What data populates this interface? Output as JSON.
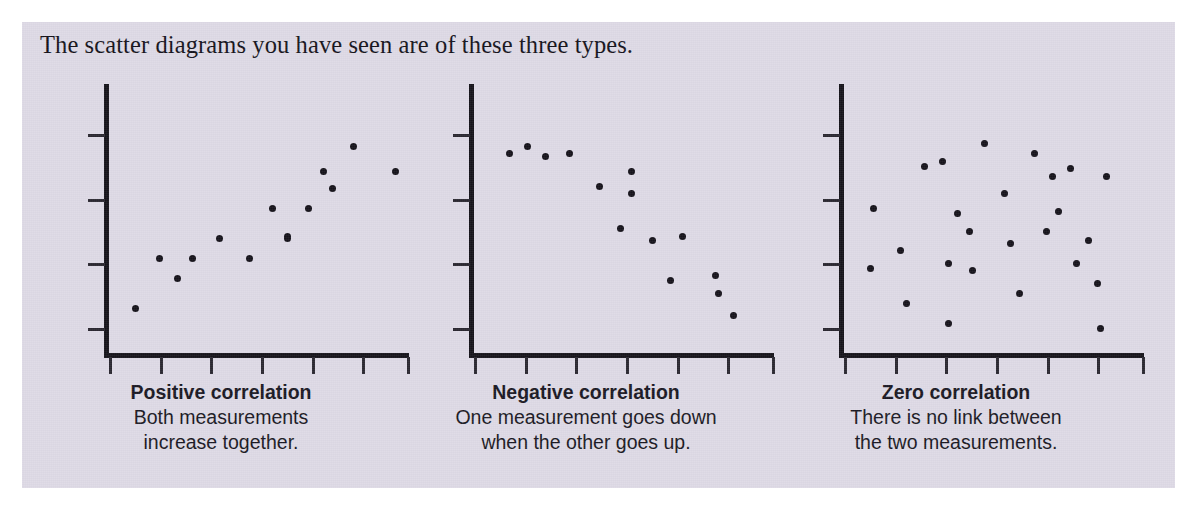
{
  "caption": "The scatter diagrams you have seen are of these three types.",
  "colors": {
    "panel_background": "#dedae6",
    "page_background": "#ffffff",
    "ink": "#15121a",
    "axis": "#15131a"
  },
  "chart_data": [
    {
      "type": "scatter",
      "title": "Positive correlation",
      "description_lines": [
        "Both measurements",
        "increase together."
      ],
      "xlabel": "",
      "ylabel": "",
      "xlim": [
        0,
        100
      ],
      "ylim": [
        0,
        100
      ],
      "grid": false,
      "legend": "none",
      "x_ticks": [
        0,
        17,
        34,
        51,
        68,
        85,
        100
      ],
      "y_ticks": [
        10,
        36,
        62,
        88
      ],
      "points": [
        {
          "x": 9,
          "y": 18
        },
        {
          "x": 17,
          "y": 38
        },
        {
          "x": 23,
          "y": 30
        },
        {
          "x": 28,
          "y": 38
        },
        {
          "x": 37,
          "y": 46
        },
        {
          "x": 47,
          "y": 38
        },
        {
          "x": 55,
          "y": 58
        },
        {
          "x": 60,
          "y": 47
        },
        {
          "x": 60,
          "y": 46
        },
        {
          "x": 67,
          "y": 58
        },
        {
          "x": 75,
          "y": 66
        },
        {
          "x": 72,
          "y": 73
        },
        {
          "x": 82,
          "y": 83
        },
        {
          "x": 96,
          "y": 73
        }
      ]
    },
    {
      "type": "scatter",
      "title": "Negative correlation",
      "description_lines": [
        "One measurement goes down",
        "when the other goes up."
      ],
      "xlabel": "",
      "ylabel": "",
      "xlim": [
        0,
        100
      ],
      "ylim": [
        0,
        100
      ],
      "grid": false,
      "legend": "none",
      "x_ticks": [
        0,
        17,
        34,
        51,
        68,
        85,
        100
      ],
      "y_ticks": [
        10,
        36,
        62,
        88
      ],
      "points": [
        {
          "x": 12,
          "y": 80
        },
        {
          "x": 18,
          "y": 83
        },
        {
          "x": 24,
          "y": 79
        },
        {
          "x": 32,
          "y": 80
        },
        {
          "x": 42,
          "y": 67
        },
        {
          "x": 53,
          "y": 73
        },
        {
          "x": 53,
          "y": 64
        },
        {
          "x": 49,
          "y": 50
        },
        {
          "x": 60,
          "y": 45
        },
        {
          "x": 70,
          "y": 47
        },
        {
          "x": 66,
          "y": 29
        },
        {
          "x": 81,
          "y": 31
        },
        {
          "x": 82,
          "y": 24
        },
        {
          "x": 87,
          "y": 15
        }
      ]
    },
    {
      "type": "scatter",
      "title": "Zero correlation",
      "description_lines": [
        "There is no link between",
        "the two measurements."
      ],
      "xlabel": "",
      "ylabel": "",
      "xlim": [
        0,
        100
      ],
      "ylim": [
        0,
        100
      ],
      "grid": false,
      "legend": "none",
      "x_ticks": [
        0,
        17,
        34,
        51,
        68,
        85,
        100
      ],
      "y_ticks": [
        10,
        36,
        62,
        88
      ],
      "points": [
        {
          "x": 10,
          "y": 58
        },
        {
          "x": 9,
          "y": 34
        },
        {
          "x": 19,
          "y": 41
        },
        {
          "x": 21,
          "y": 20
        },
        {
          "x": 27,
          "y": 75
        },
        {
          "x": 33,
          "y": 77
        },
        {
          "x": 38,
          "y": 56
        },
        {
          "x": 35,
          "y": 36
        },
        {
          "x": 35,
          "y": 12
        },
        {
          "x": 42,
          "y": 49
        },
        {
          "x": 43,
          "y": 33
        },
        {
          "x": 47,
          "y": 84
        },
        {
          "x": 54,
          "y": 64
        },
        {
          "x": 56,
          "y": 44
        },
        {
          "x": 59,
          "y": 24
        },
        {
          "x": 64,
          "y": 80
        },
        {
          "x": 68,
          "y": 49
        },
        {
          "x": 70,
          "y": 71
        },
        {
          "x": 72,
          "y": 57
        },
        {
          "x": 76,
          "y": 74
        },
        {
          "x": 78,
          "y": 36
        },
        {
          "x": 82,
          "y": 45
        },
        {
          "x": 85,
          "y": 28
        },
        {
          "x": 86,
          "y": 10
        },
        {
          "x": 88,
          "y": 71
        }
      ]
    }
  ]
}
